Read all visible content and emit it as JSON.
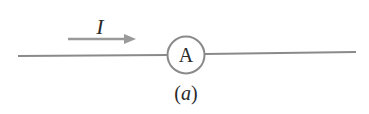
{
  "diagram": {
    "current_label": "I",
    "meter_label": "A",
    "caption": "(a)",
    "caption_parts": {
      "open": "(",
      "letter": "a",
      "close": ")"
    },
    "colors": {
      "wire": "#8a8a8a",
      "arrow": "#9a9a9a",
      "text": "#2a2a2a"
    }
  }
}
